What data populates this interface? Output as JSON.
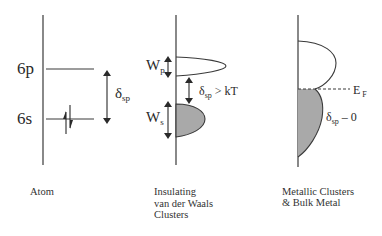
{
  "diagram": {
    "type": "energy-level / density-of-states schematic",
    "panels": [
      {
        "id": "atom",
        "caption": [
          "Atom"
        ],
        "levels": [
          {
            "label": "6p",
            "occupied": false
          },
          {
            "label": "6s",
            "occupied": true,
            "electrons": "spin-up / spin-down pair"
          }
        ],
        "gap": {
          "symbol": "δ",
          "subscript": "sp"
        }
      },
      {
        "id": "insulating-vdw-clusters",
        "caption": [
          "Insulating",
          "van der Waals",
          "Clusters"
        ],
        "bands": [
          {
            "symbol": "W",
            "subscript": "p",
            "filled": false
          },
          {
            "symbol": "W",
            "subscript": "s",
            "filled": true
          }
        ],
        "gap": {
          "symbol": "δ",
          "subscript": "sp",
          "relation": " > kT"
        }
      },
      {
        "id": "metallic-clusters-bulk",
        "caption": [
          "Metallic Clusters",
          "& Bulk Metal"
        ],
        "fermi": {
          "symbol": "E",
          "subscript": "F"
        },
        "gap": {
          "symbol": "δ",
          "subscript": "sp",
          "relation": " – 0"
        }
      }
    ],
    "colors": {
      "line": "#3a3a3a",
      "filled_band": "#a9a9a9",
      "background": "#ffffff"
    }
  }
}
